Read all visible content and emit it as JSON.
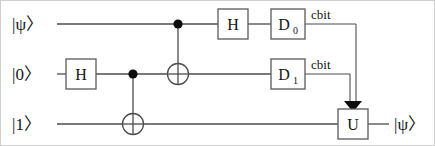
{
  "diagram": {
    "type": "quantum-circuit",
    "colors": {
      "wire": "#4d4d4d",
      "box_stroke": "#5a5a5a",
      "control_dot": "#0d0d0d",
      "text": "#141414",
      "background": "#ffffff"
    }
  },
  "wires": [
    {
      "id": "q0",
      "input_label": "|ψ〉",
      "output_label": "",
      "y": 24
    },
    {
      "id": "q1",
      "input_label": "|0〉",
      "output_label": "",
      "y": 74
    },
    {
      "id": "q2",
      "input_label": "|1〉",
      "output_label": "|ψ〉",
      "y": 124
    }
  ],
  "gates": [
    {
      "id": "h1",
      "label": "H",
      "subscript": "",
      "wire": "q1",
      "x": 81,
      "kind": "box"
    },
    {
      "id": "h2",
      "label": "H",
      "subscript": "",
      "wire": "q0",
      "x": 233,
      "kind": "box"
    },
    {
      "id": "d0",
      "label": "D",
      "subscript": "0",
      "wire": "q0",
      "x": 288,
      "kind": "box"
    },
    {
      "id": "d1",
      "label": "D",
      "subscript": "1",
      "wire": "q1",
      "x": 288,
      "kind": "box"
    },
    {
      "id": "u",
      "label": "U",
      "subscript": "",
      "wire": "q2",
      "x": 353,
      "kind": "box"
    }
  ],
  "cnots": [
    {
      "id": "cnot1",
      "control_wire": "q1",
      "target_wire": "q2",
      "x": 133
    },
    {
      "id": "cnot2",
      "control_wire": "q0",
      "target_wire": "q1",
      "x": 178
    }
  ],
  "classical_wires": [
    {
      "id": "cbit0",
      "label": "cbit",
      "from_gate": "d0",
      "to_gate": "u",
      "label_x": 330,
      "label_y": 17
    },
    {
      "id": "cbit1",
      "label": "cbit",
      "from_gate": "d1",
      "to_gate": "u",
      "label_x": 330,
      "label_y": 67
    }
  ]
}
